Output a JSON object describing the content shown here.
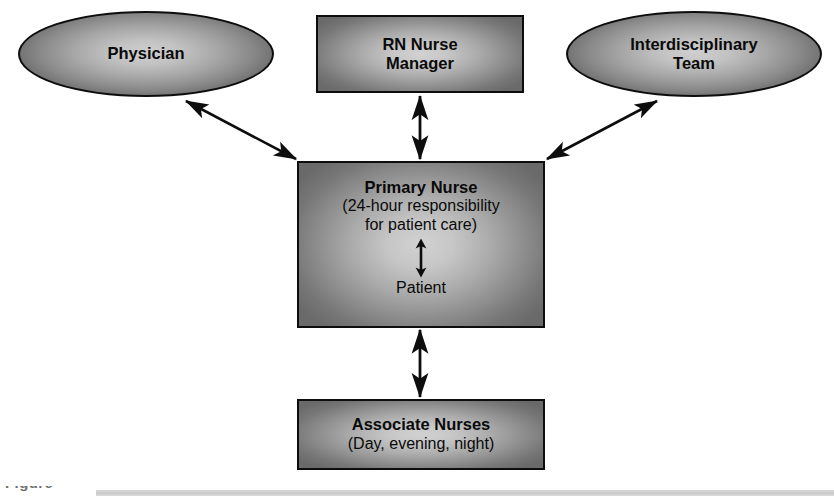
{
  "diagram": {
    "nodes": {
      "physician": {
        "label": "Physician",
        "shape": "ellipse"
      },
      "rn_nurse_manager": {
        "label_line1": "RN Nurse",
        "label_line2": "Manager",
        "shape": "rectangle"
      },
      "interdisciplinary_team": {
        "label_line1": "Interdisciplinary",
        "label_line2": "Team",
        "shape": "ellipse"
      },
      "primary_nurse": {
        "title": "Primary Nurse",
        "subtitle_line1": "(24-hour responsibility",
        "subtitle_line2": "for patient care)",
        "patient_label": "Patient",
        "shape": "rectangle"
      },
      "associate_nurses": {
        "title": "Associate Nurses",
        "subtitle": "(Day, evening, night)",
        "shape": "rectangle"
      }
    },
    "connectors": [
      {
        "from": "primary_nurse",
        "to": "physician",
        "style": "double-arrow-diagonal"
      },
      {
        "from": "primary_nurse",
        "to": "rn_nurse_manager",
        "style": "double-arrow-vertical"
      },
      {
        "from": "primary_nurse",
        "to": "interdisciplinary_team",
        "style": "double-arrow-diagonal"
      },
      {
        "from": "primary_nurse",
        "to": "patient",
        "style": "double-arrow-vertical-internal"
      },
      {
        "from": "primary_nurse",
        "to": "associate_nurses",
        "style": "double-arrow-vertical"
      }
    ],
    "colors": {
      "outline": "#0d0d0d",
      "fill_center": "#d2d2d2",
      "fill_edge": "#6a6a6a",
      "text": "#0a0a0a",
      "caption_bar": "#d2d2d2"
    }
  },
  "caption": {
    "fragment": "Figure"
  }
}
